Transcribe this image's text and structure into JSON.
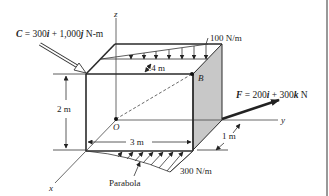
{
  "figure": {
    "couple_label": {
      "prefix": "C",
      "text": " = 300i + 1,000j N-m"
    },
    "couple": {
      "symbol": "C",
      "i": "300",
      "j": "1,000",
      "unit": "N-m"
    },
    "force": {
      "symbol": "F",
      "i": "200",
      "k": "300",
      "unit": "N"
    },
    "top_load": "100 N/m",
    "bottom_load": "300 N/m",
    "bottom_load_shape": "Parabola",
    "dimensions": {
      "depth_top": ".4 m",
      "height": "2 m",
      "width": "3 m",
      "offset": "1 m"
    },
    "points": {
      "B": "B",
      "O": "O"
    },
    "axes": {
      "x": "x",
      "y": "y",
      "z": "z"
    },
    "colors": {
      "shaded_face": "#c8c8c8",
      "line": "#2a2a2a"
    }
  }
}
